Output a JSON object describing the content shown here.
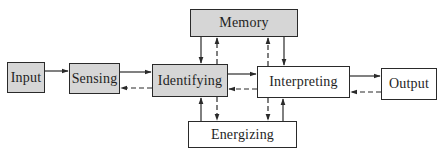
{
  "diagram": {
    "type": "block-flow",
    "colors": {
      "shaded_fill": "#d6d6d6",
      "plain_fill": "#ffffff",
      "stroke": "#2a2a2a"
    },
    "nodes": [
      {
        "id": "input",
        "label": "Input",
        "fill": "shaded"
      },
      {
        "id": "sensing",
        "label": "Sensing",
        "fill": "shaded"
      },
      {
        "id": "identifying",
        "label": "Identifying",
        "fill": "shaded"
      },
      {
        "id": "memory",
        "label": "Memory",
        "fill": "shaded"
      },
      {
        "id": "interpreting",
        "label": "Interpreting",
        "fill": "plain"
      },
      {
        "id": "energizing",
        "label": "Energizing",
        "fill": "plain"
      },
      {
        "id": "output",
        "label": "Output",
        "fill": "plain"
      }
    ],
    "edges": [
      {
        "from": "input",
        "to": "sensing",
        "style": "solid"
      },
      {
        "from": "sensing",
        "to": "identifying",
        "style": "solid"
      },
      {
        "from": "identifying",
        "to": "sensing",
        "style": "dashed"
      },
      {
        "from": "identifying",
        "to": "interpreting",
        "style": "solid"
      },
      {
        "from": "interpreting",
        "to": "identifying",
        "style": "dashed"
      },
      {
        "from": "interpreting",
        "to": "output",
        "style": "solid"
      },
      {
        "from": "output",
        "to": "interpreting",
        "style": "dashed"
      },
      {
        "from": "memory",
        "to": "identifying",
        "style": "solid"
      },
      {
        "from": "identifying",
        "to": "memory",
        "style": "dashed"
      },
      {
        "from": "memory",
        "to": "interpreting",
        "style": "solid"
      },
      {
        "from": "interpreting",
        "to": "memory",
        "style": "dashed"
      },
      {
        "from": "energizing",
        "to": "identifying",
        "style": "solid"
      },
      {
        "from": "identifying",
        "to": "energizing",
        "style": "dashed"
      },
      {
        "from": "energizing",
        "to": "interpreting",
        "style": "solid"
      },
      {
        "from": "interpreting",
        "to": "energizing",
        "style": "dashed"
      }
    ]
  }
}
